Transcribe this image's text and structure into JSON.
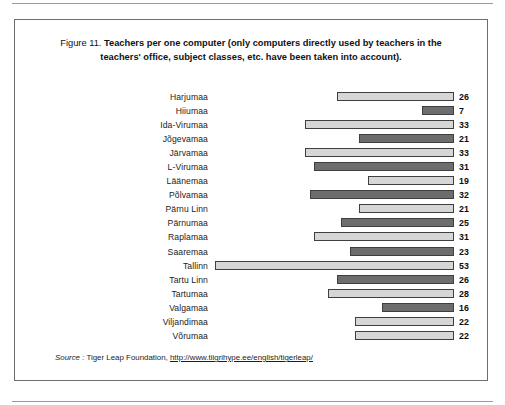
{
  "figure": {
    "label": "Figure 11.",
    "title": "Teachers per one computer (only computers directly used by teachers in the teachers' office, subject classes, etc. have been taken into account).",
    "title_line1": "Teachers per one computer (only computers directly used by teachers",
    "title_line2": "in the teachers' office, subject classes, etc. have been taken into account)."
  },
  "source": {
    "label": "Source :",
    "publisher": "Tiger Leap Foundation,",
    "url": "http://www.tiigrihype.ee/english/tigerleap/"
  },
  "colors": {
    "bar_light": "#d6d6d6",
    "bar_dark": "#6d6d6d",
    "bar_border": "#3f3f3f",
    "frame": "#6d6d6d",
    "text": "#1a1a1a"
  },
  "chart_data": {
    "type": "bar",
    "orientation": "horizontal",
    "title": "Teachers per one computer (only computers directly used by teachers in the teachers' office, subject classes, etc. have been taken into account).",
    "xlabel": "",
    "ylabel": "",
    "xlim": [
      0,
      53
    ],
    "grid": false,
    "legend": "none",
    "bar_alignment": "right-aligned, bars grow leftward from a common right baseline",
    "data_labels": true,
    "categories": [
      "Harjumaa",
      "Hiiumaa",
      "Ida-Virumaa",
      "Jõgevamaa",
      "Järvamaa",
      "L-Virumaa",
      "Läänemaa",
      "Põlvamaa",
      "Pärnu Linn",
      "Pärnumaa",
      "Raplamaa",
      "Saaremaa",
      "Tallinn",
      "Tartu Linn",
      "Tartumaa",
      "Valgamaa",
      "Viljandimaa",
      "Võrumaa"
    ],
    "values": [
      26,
      7,
      33,
      21,
      33,
      31,
      19,
      32,
      21,
      25,
      31,
      23,
      53,
      26,
      28,
      16,
      22,
      22
    ],
    "shades": [
      "light",
      "dark",
      "light",
      "dark",
      "light",
      "dark",
      "light",
      "dark",
      "light",
      "dark",
      "light",
      "dark",
      "light",
      "dark",
      "light",
      "dark",
      "light",
      "light"
    ]
  }
}
